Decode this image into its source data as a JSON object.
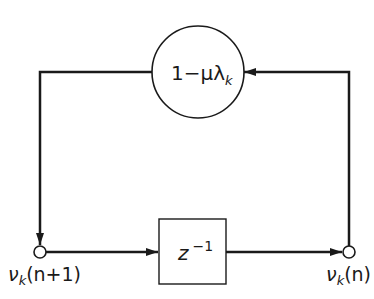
{
  "diagram": {
    "type": "signal-flow",
    "gain_block": {
      "label_main": "1−μλ",
      "label_sub": "k",
      "shape": "circle"
    },
    "delay_block": {
      "label_main": "z",
      "label_sup": "−1",
      "shape": "rectangle"
    },
    "nodes": [
      {
        "id": "input",
        "label_v": "ν",
        "label_sub": "k",
        "label_arg": "(n+1)"
      },
      {
        "id": "output",
        "label_v": "ν",
        "label_sub": "k",
        "label_arg": "(n)"
      }
    ],
    "edges": [
      {
        "from": "input",
        "to": "delay_block",
        "direction": "right"
      },
      {
        "from": "delay_block",
        "to": "output",
        "direction": "right"
      },
      {
        "from": "output",
        "to": "gain_block",
        "direction": "up-left"
      },
      {
        "from": "gain_block",
        "to": "input",
        "direction": "left-down"
      }
    ],
    "colors": {
      "stroke": "#1a1a1a",
      "background": "#ffffff"
    }
  }
}
